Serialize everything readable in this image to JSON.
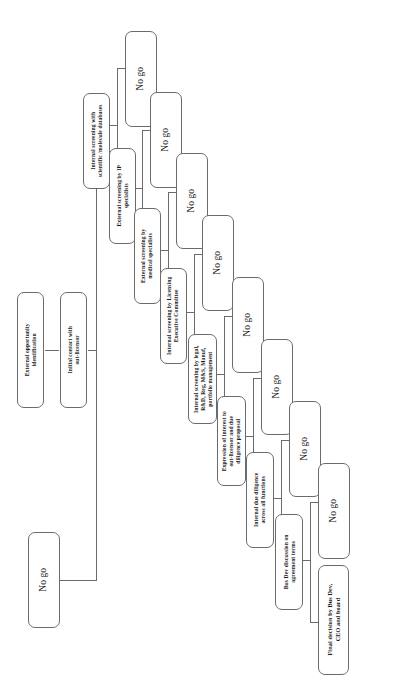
{
  "diagram": {
    "orientation": "rotated-90-ccw",
    "line_color": "#6b6b6b",
    "box_fill": "#ffffff",
    "text_color": "#1a1a1a",
    "nodes": [
      {
        "id": "n1",
        "kind": "process",
        "label": "External opportunity identification",
        "lines": [
          "External opportunity",
          "identification"
        ]
      },
      {
        "id": "n2",
        "kind": "process",
        "label": "Initial contact with out-licensor",
        "lines": [
          "Initial contact with",
          "out-licensor"
        ]
      },
      {
        "id": "n3",
        "kind": "process",
        "label": "Internal screening with scientific /molecule databases",
        "lines": [
          "Internal screening with",
          "scientific /molecule databases"
        ]
      },
      {
        "id": "n4",
        "kind": "process",
        "label": "External screening by IP specialists",
        "lines": [
          "External screening by IP",
          "specialists"
        ]
      },
      {
        "id": "n5",
        "kind": "process",
        "label": "External screening by medical specialists",
        "lines": [
          "External screening by",
          "medical specialists"
        ]
      },
      {
        "id": "n6",
        "kind": "process",
        "label": "Internal screening by Licensing Executive Committee",
        "lines": [
          "Internal screening by Licensing",
          "Executive Committee"
        ]
      },
      {
        "id": "n7",
        "kind": "process",
        "label": "Internal screening by legal, R&D, Reg, M&S, Manuf, portfolio management",
        "lines": [
          "Internal screening by legal,",
          "R&D, Reg, M&S, Manuf,",
          "portfolio management"
        ]
      },
      {
        "id": "n8",
        "kind": "process",
        "label": "Expression of interest to out-licensor and due diligence proposal",
        "lines": [
          "Expression of interest to",
          "out-licensor and due",
          "diligence proposal"
        ]
      },
      {
        "id": "n9",
        "kind": "process",
        "label": "Internal due diligence across all functions",
        "lines": [
          "Internal due diligence",
          "across all functions"
        ]
      },
      {
        "id": "n10",
        "kind": "process",
        "label": "Bus Dev discussion on agreement terms",
        "lines": [
          "Bus Dev discussion on",
          "agreement terms"
        ]
      },
      {
        "id": "n11",
        "kind": "terminal",
        "label": "Final decision by Bus Dev, CEO and board",
        "lines": [
          "Final decision by Bus Dev,",
          "CEO and board"
        ]
      }
    ],
    "nogo_label": "No go",
    "nogo_nodes": [
      {
        "id": "ng1",
        "label": "No go",
        "from": "n3"
      },
      {
        "id": "ng2",
        "label": "No go",
        "from": "n4"
      },
      {
        "id": "ng3",
        "label": "No go",
        "from": "n5"
      },
      {
        "id": "ng4",
        "label": "No go",
        "from": "n6"
      },
      {
        "id": "ng5",
        "label": "No go",
        "from": "n7"
      },
      {
        "id": "ng6",
        "label": "No go",
        "from": "n8"
      },
      {
        "id": "ng7",
        "label": "No go",
        "from": "n9"
      },
      {
        "id": "ng8",
        "label": "No go",
        "from": "n10"
      },
      {
        "id": "ng9",
        "label": "No go",
        "from": "n2"
      }
    ]
  }
}
